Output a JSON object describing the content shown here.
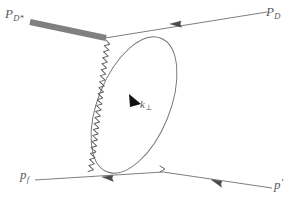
{
  "figure": {
    "type": "feynman-diagram",
    "background_color": "#ffffff",
    "line_color": "#6b6b6b",
    "thick_line_color": "#808080",
    "arrow_color": "#000000"
  },
  "labels": {
    "incoming_dstar": {
      "base": "P",
      "sub": "D*"
    },
    "outgoing_d": {
      "base": "P",
      "sub": "D"
    },
    "outgoing_pf": {
      "base": "p",
      "sub": "f"
    },
    "outgoing_pprime": {
      "base": "p",
      "prime": "′"
    },
    "loop_momentum": {
      "base": "k",
      "sub": "⊥"
    }
  },
  "elements": {
    "thick_propagator": {
      "name": "D* meson propagator",
      "x1": 30,
      "y1": 22,
      "x2": 106,
      "y2": 38,
      "width": 6,
      "color": "#808080"
    },
    "d_line": {
      "name": "D meson line",
      "x1": 106,
      "y1": 38,
      "x2": 266,
      "y2": 12,
      "arrow_at": {
        "x": 176,
        "y": 24
      },
      "arrow_direction": "left"
    },
    "pf_line": {
      "name": "final proton line",
      "x1": 163,
      "y1": 172,
      "x2": 36,
      "y2": 180,
      "arrow_at": {
        "x": 107,
        "y": 176
      },
      "arrow_direction": "left"
    },
    "pprime_line": {
      "name": "scattered proton line",
      "x1": 163,
      "y1": 172,
      "x2": 271,
      "y2": 187,
      "arrow_at": {
        "x": 216,
        "y": 180
      },
      "arrow_direction": "left"
    },
    "blob_ellipse": {
      "name": "interaction blob",
      "cx": 134,
      "cy": 105,
      "rx": 36,
      "ry": 72,
      "rotation_deg": 22
    },
    "wavy_line": {
      "name": "gluon / exchange wavy line",
      "from": {
        "x": 106,
        "y": 40
      },
      "to": {
        "x": 163,
        "y": 172
      },
      "style": "zigzag-wave"
    },
    "k_arrow": {
      "name": "momentum direction arrowhead",
      "x": 136,
      "y": 101,
      "angle_deg": 66
    }
  }
}
